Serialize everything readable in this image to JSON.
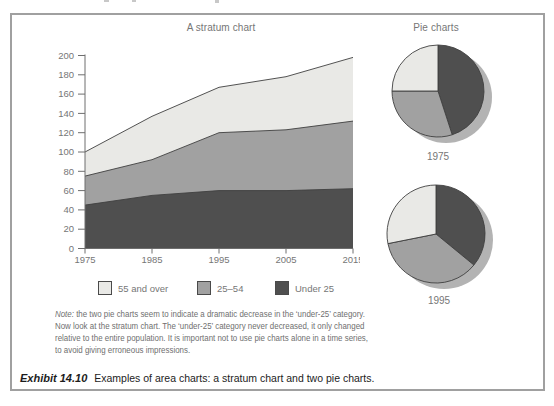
{
  "page": {
    "stratum_title": "A stratum chart",
    "pies_title": "Pie charts"
  },
  "legend": {
    "items": [
      {
        "label": "55 and over",
        "color": "#e9e9e6"
      },
      {
        "label": "25–54",
        "color": "#a1a1a1"
      },
      {
        "label": "Under 25",
        "color": "#4f4f4f"
      }
    ]
  },
  "note": {
    "label": "Note:",
    "lines": [
      " the two pie charts seem to indicate a dramatic decrease in the ‘under-25’ category.",
      "Now look at the stratum chart. The ‘under-25’ category never decreased, it only changed",
      "relative to the entire population. It is important not to use pie charts alone in a time series,",
      "to avoid giving erroneous impressions."
    ]
  },
  "caption": {
    "label": "Exhibit 14.10",
    "text": "Examples of area charts: a stratum chart and two pie charts."
  },
  "chart_data": [
    {
      "type": "area",
      "title": "A stratum chart",
      "stacked": true,
      "x": [
        1975,
        1985,
        1995,
        2005,
        2015
      ],
      "series": [
        {
          "name": "Under 25",
          "values": [
            45,
            55,
            60,
            60,
            62
          ],
          "color": "#4f4f4f"
        },
        {
          "name": "25–54",
          "values": [
            30,
            37,
            60,
            63,
            70
          ],
          "color": "#a1a1a1"
        },
        {
          "name": "55 and over",
          "values": [
            25,
            45,
            47,
            55,
            66
          ],
          "color": "#e9e9e6"
        }
      ],
      "stacked_totals": [
        100,
        137,
        167,
        178,
        198
      ],
      "ylim": [
        0,
        200
      ],
      "ytick_step": 20,
      "grid": false,
      "legend_position": "bottom"
    },
    {
      "type": "pie",
      "label": "1975",
      "slices": [
        {
          "name": "Under 25",
          "value": 45,
          "color": "#4f4f4f"
        },
        {
          "name": "25–54",
          "value": 30,
          "color": "#a1a1a1"
        },
        {
          "name": "55 and over",
          "value": 25,
          "color": "#e9e9e6"
        }
      ]
    },
    {
      "type": "pie",
      "label": "1995",
      "slices": [
        {
          "name": "Under 25",
          "value": 60,
          "color": "#4f4f4f"
        },
        {
          "name": "25–54",
          "value": 60,
          "color": "#a1a1a1"
        },
        {
          "name": "55 and over",
          "value": 47,
          "color": "#e9e9e6"
        }
      ]
    }
  ],
  "colors": {
    "box_border": "#a0a0a0",
    "axis": "#6e6e6e",
    "outline": "#3f3f3f",
    "shadow": "#b3b3b3",
    "text_gray": "#767676"
  }
}
